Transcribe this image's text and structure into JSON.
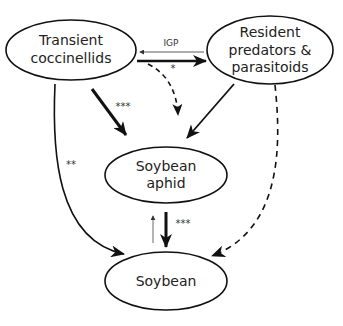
{
  "diagram": {
    "type": "food-web interaction diagram",
    "nodes": [
      {
        "id": "transient",
        "lines": [
          "Transient",
          "coccinellids"
        ]
      },
      {
        "id": "resident",
        "lines": [
          "Resident",
          "predators &",
          "parasitoids"
        ]
      },
      {
        "id": "aphid",
        "lines": [
          "Soybean",
          "aphid"
        ]
      },
      {
        "id": "soybean",
        "lines": [
          "Soybean"
        ]
      }
    ],
    "edges": [
      {
        "from": "resident",
        "to": "transient",
        "label": "IGP",
        "style": "thin solid"
      },
      {
        "from": "transient",
        "to": "resident",
        "label": "*",
        "style": "thick solid"
      },
      {
        "from": "transient",
        "to": "aphid",
        "label": "*",
        "style": "dashed"
      },
      {
        "from": "transient",
        "to": "aphid",
        "label": "***",
        "style": "thick solid"
      },
      {
        "from": "resident",
        "to": "aphid",
        "label": "",
        "style": "solid"
      },
      {
        "from": "transient",
        "to": "soybean",
        "label": "**",
        "style": "solid curved"
      },
      {
        "from": "resident",
        "to": "soybean",
        "label": "",
        "style": "dashed curved"
      },
      {
        "from": "aphid",
        "to": "soybean",
        "label": "***",
        "style": "thick solid"
      },
      {
        "from": "soybean",
        "to": "aphid",
        "label": "",
        "style": "thin solid"
      }
    ],
    "labels": {
      "igp": "IGP",
      "star1": "*",
      "star3_top": "***",
      "star2": "**",
      "star3_bottom": "***"
    }
  }
}
